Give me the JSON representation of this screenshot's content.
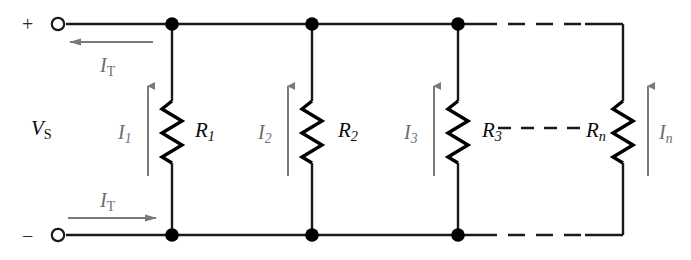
{
  "figure": {
    "width": 691,
    "height": 260,
    "background": "#ffffff"
  },
  "colors": {
    "wire": "#1a1a1a",
    "resistor": "#000000",
    "current_arrow": "#7a7a7a",
    "label": "#0d0d0d",
    "current_label": "#6d6d6d",
    "node": "#000000"
  },
  "source": {
    "label": "V",
    "label_sub": "S",
    "plus_sign": "+",
    "minus_sign": "−"
  },
  "total_current": {
    "label": "I",
    "label_sub": "T",
    "top_direction": "left",
    "bottom_direction": "right"
  },
  "branches": [
    {
      "resistor_label": "R",
      "resistor_sub": "1",
      "current_label": "I",
      "current_sub": "1",
      "current_direction": "up"
    },
    {
      "resistor_label": "R",
      "resistor_sub": "2",
      "current_label": "I",
      "current_sub": "2",
      "current_direction": "up"
    },
    {
      "resistor_label": "R",
      "resistor_sub": "3",
      "current_label": "I",
      "current_sub": "3",
      "current_direction": "up"
    },
    {
      "resistor_label": "R",
      "resistor_sub": "n",
      "current_label": "I",
      "current_sub": "n",
      "current_direction": "up"
    }
  ],
  "continuation": {
    "middle_dashes": "dashed-line-between-R3-and-Rn",
    "top_rail_dashes": "dashed-top-rail-segment",
    "bottom_rail_dashes": "dashed-bottom-rail-segment"
  },
  "terminals": [
    {
      "name": "positive-terminal",
      "sign": "+"
    },
    {
      "name": "negative-terminal",
      "sign": "−"
    }
  ]
}
